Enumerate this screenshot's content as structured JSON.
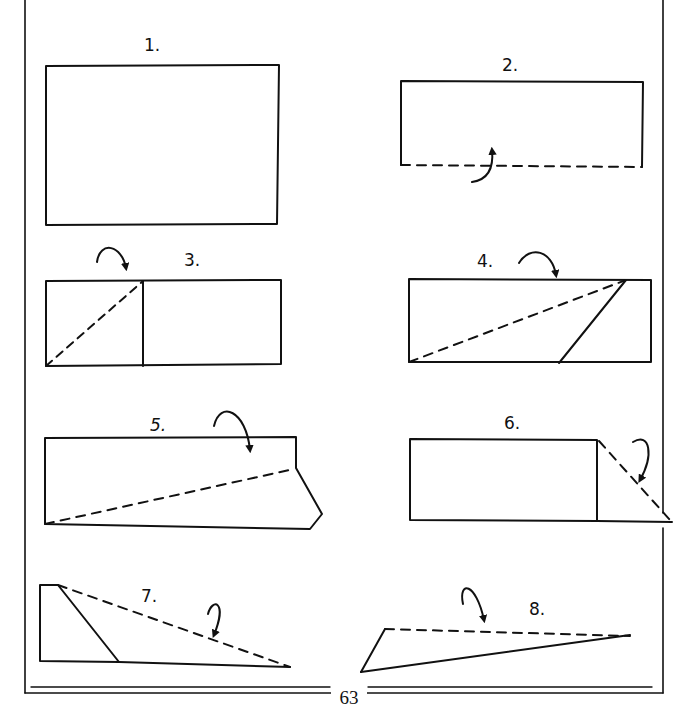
{
  "document": {
    "type": "paper airplane folding instructions",
    "page_number": "63",
    "steps": [
      {
        "number": "1.",
        "description": "Rectangular sheet of paper"
      },
      {
        "number": "2.",
        "description": "Fold bottom edge up along dashed line"
      },
      {
        "number": "3.",
        "description": "Fold top-left corner down along diagonal dashed line"
      },
      {
        "number": "4.",
        "description": "Fold top edge down along long diagonal dashed line"
      },
      {
        "number": "5.",
        "description": "Fold top section down along dashed line"
      },
      {
        "number": "6.",
        "description": "Fold right triangular flap along dashed diagonal"
      },
      {
        "number": "7.",
        "description": "Fold along long diagonal dashed line"
      },
      {
        "number": "8.",
        "description": "Fold along top dashed line to finish"
      }
    ]
  },
  "colors": {
    "ink": "#111111",
    "paper": "#ffffff"
  }
}
